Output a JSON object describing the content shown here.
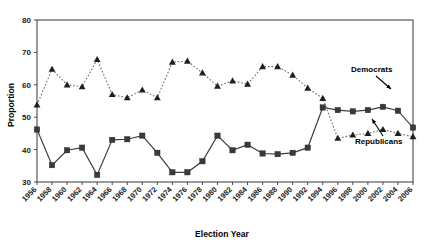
{
  "chart_data": {
    "type": "line",
    "title": "",
    "xlabel": "Election Year",
    "ylabel": "Proportion",
    "ylim": [
      30,
      80
    ],
    "yticks": [
      30,
      40,
      50,
      60,
      70,
      80
    ],
    "grid": false,
    "legend_position": "inline-annotations",
    "categories": [
      "1956",
      "1958",
      "1960",
      "1962",
      "1964",
      "1966",
      "1968",
      "1970",
      "1972",
      "1974",
      "1976",
      "1978",
      "1980",
      "1982",
      "1984",
      "1986",
      "1988",
      "1990",
      "1992",
      "1994",
      "1996",
      "1998",
      "2000",
      "2002",
      "2004",
      "2006"
    ],
    "series": [
      {
        "name": "Democrats",
        "marker": "triangle",
        "linestyle": "dotted",
        "color": "#1f1f1f",
        "values": [
          53.8,
          64.8,
          60.0,
          59.4,
          67.8,
          57.0,
          56.0,
          58.4,
          56.0,
          67.0,
          67.3,
          63.7,
          59.6,
          61.2,
          60.2,
          65.6,
          65.6,
          63.0,
          59.0,
          55.8,
          43.5,
          44.5,
          45.0,
          46.2,
          45.0,
          44.0
        ]
      },
      {
        "name": "Republicans",
        "marker": "square",
        "linestyle": "solid",
        "color": "#3a3a3a",
        "values": [
          46.2,
          35.2,
          39.8,
          40.6,
          32.2,
          43.0,
          43.2,
          44.3,
          39.0,
          33.0,
          33.0,
          36.4,
          44.3,
          39.8,
          41.5,
          38.8,
          38.6,
          39.0,
          40.6,
          53.0,
          52.2,
          51.8,
          52.2,
          53.2,
          52.0,
          46.8
        ]
      }
    ],
    "annotations": [
      {
        "text": "Democrats",
        "points_to_series": "Democrats"
      },
      {
        "text": "Republicans",
        "points_to_series": "Republicans"
      }
    ]
  },
  "axis": {
    "y_title": "Proportion",
    "x_title": "Election Year"
  }
}
